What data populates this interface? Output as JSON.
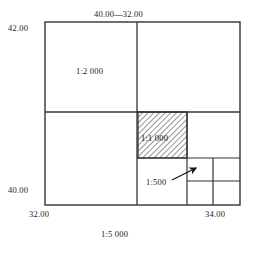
{
  "figure": {
    "type": "map-sheet-subdivision-diagram",
    "caption": "1:5 000",
    "axis_labels": {
      "top": "40.00—32.00",
      "top_left": "42.00",
      "bottom_left": "40.00",
      "x_left": "32.00",
      "x_right": "34.00"
    },
    "regions": [
      {
        "name": "sheet-1-2000",
        "label": "1:2 000",
        "hatched": false
      },
      {
        "name": "sheet-1-1000",
        "label": "1:1 000",
        "hatched": true
      },
      {
        "name": "sheet-1-500",
        "label": "1:500",
        "hatched": false
      }
    ],
    "annotations": {
      "pointer_500": "arrow-pointing-to-1-500-cell"
    },
    "colors": {
      "ink": "#1a1a1a",
      "frame": "#333333",
      "hatch": "#3a3a3a",
      "paper": "#ffffff"
    }
  }
}
